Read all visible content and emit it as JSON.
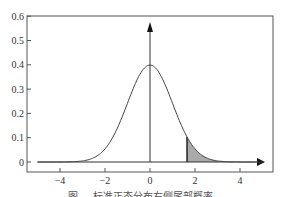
{
  "chart_data": {
    "type": "line",
    "title": "",
    "caption": "图 … 标准正态分布右侧尾部概率",
    "xlabel": "",
    "ylabel": "",
    "xlim": [
      -5.2,
      5.3
    ],
    "ylim": [
      0,
      0.6
    ],
    "x_ticks": [
      "-4",
      "-2",
      "0",
      "2",
      "4"
    ],
    "y_ticks": [
      "0",
      "0.1",
      "0.2",
      "0.3",
      "0.4",
      "0.5",
      "0.6"
    ],
    "series": [
      {
        "name": "standard normal pdf",
        "function": "exp(-x^2/2)/sqrt(2*pi)",
        "x_range": [
          -5,
          5
        ],
        "peak": {
          "x": 0,
          "y": 0.4
        }
      }
    ],
    "shaded_region": {
      "from_x": 1.645,
      "to_x": 5,
      "fill": "#aaaaaa",
      "label": "right tail"
    },
    "vertical_line_at_x": 1.645,
    "axis_arrows": true,
    "grid": false
  }
}
